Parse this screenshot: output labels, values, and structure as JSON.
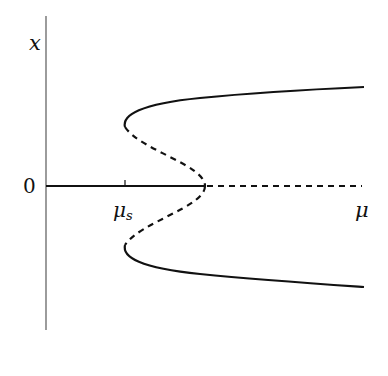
{
  "diagram": {
    "type": "bifurcation-diagram",
    "axes": {
      "y_label": "x",
      "x_label": "μ",
      "origin_label": "0",
      "tick_label_main": "μ",
      "tick_label_sub": "s"
    },
    "branches": [
      {
        "name": "trivial-stable",
        "style": "solid",
        "range": "0 to μ_c"
      },
      {
        "name": "trivial-unstable",
        "style": "dashed",
        "range": "μ_c onward"
      },
      {
        "name": "upper-unstable",
        "style": "dashed",
        "range": "μ_s to μ_c"
      },
      {
        "name": "upper-stable",
        "style": "solid",
        "range": "μ_s onward"
      },
      {
        "name": "lower-unstable",
        "style": "dashed",
        "range": "μ_s to μ_c"
      },
      {
        "name": "lower-stable",
        "style": "solid",
        "range": "μ_s onward"
      }
    ],
    "colors": {
      "line": "#111111",
      "background": "#ffffff"
    }
  }
}
